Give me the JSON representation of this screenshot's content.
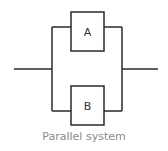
{
  "diagram": {
    "type": "reliability-block-diagram",
    "blocks": [
      {
        "id": "A",
        "label": "A"
      },
      {
        "id": "B",
        "label": "B"
      }
    ],
    "caption": "Parallel system",
    "colors": {
      "line": "#2a2a2a",
      "caption": "#8a8a8a"
    }
  }
}
